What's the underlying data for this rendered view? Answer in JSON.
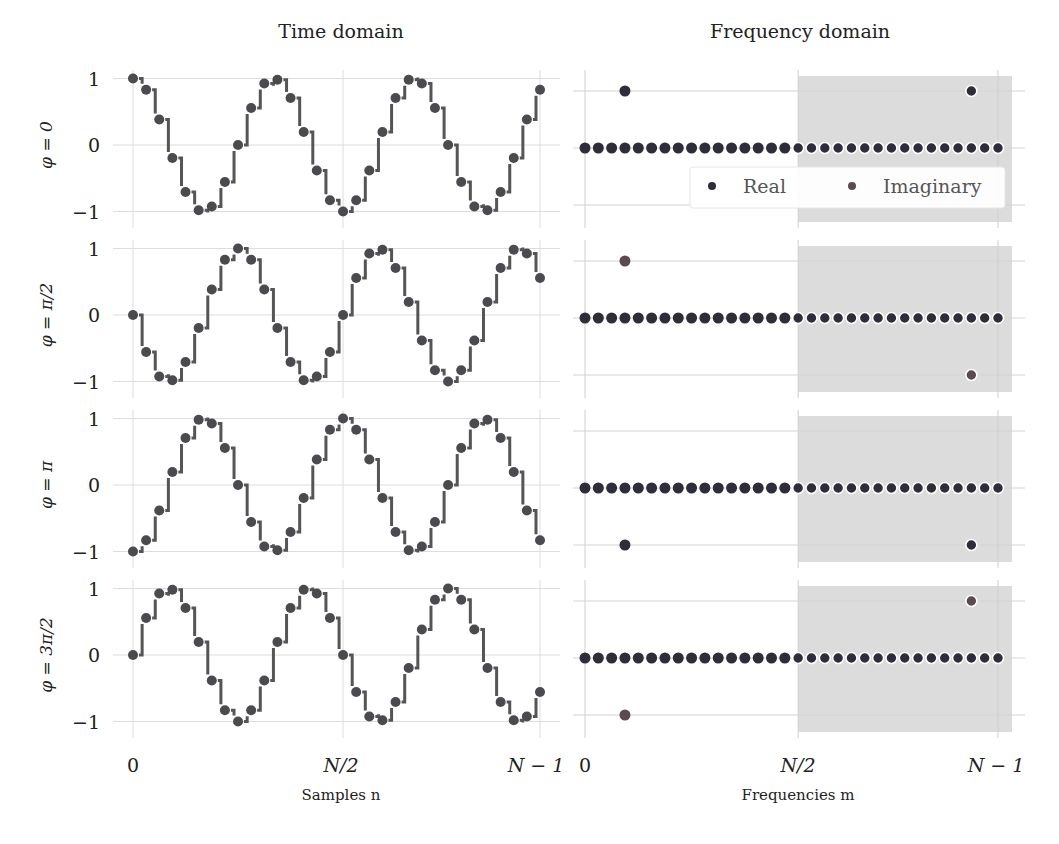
{
  "chart_data": {
    "type": "scatter",
    "title_left": "Time domain",
    "title_right": "Frequency domain",
    "N": 32,
    "time_domain": {
      "xlabel": "Samples n",
      "xticks": [
        "0",
        "N/2",
        "N − 1"
      ],
      "xtick_positions": [
        0,
        16,
        31
      ],
      "yticks": [
        "1",
        "0",
        "−1"
      ],
      "ytick_values": [
        1,
        0,
        -1
      ],
      "ylim": [
        -1.15,
        1.15
      ],
      "style": "step markers"
    },
    "frequency_domain": {
      "xlabel": "Frequencies m",
      "xticks": [
        "0",
        "N/2",
        "N − 1"
      ],
      "xtick_positions": [
        0,
        16,
        31
      ],
      "ygrid_values": [
        0.5,
        0,
        -0.5
      ],
      "ylim": [
        -0.6,
        0.6
      ],
      "shaded_region": [
        16,
        31.5
      ],
      "legend": [
        {
          "label": "Real",
          "color": "#2e2e3a"
        },
        {
          "label": "Imaginary",
          "color": "#5a4b52"
        }
      ]
    },
    "rows": [
      {
        "ylabel": "φ = 0",
        "samples": [
          1,
          0.831,
          0.383,
          -0.195,
          -0.707,
          -0.981,
          -0.924,
          -0.556,
          0,
          0.556,
          0.924,
          0.981,
          0.707,
          0.195,
          -0.383,
          -0.831,
          -1,
          -0.831,
          -0.383,
          0.195,
          0.707,
          0.981,
          0.924,
          0.556,
          0,
          -0.556,
          -0.924,
          -0.981,
          -0.707,
          -0.195,
          0.383,
          0.831
        ],
        "spectrum_peaks": [
          {
            "m": 3,
            "value": 0.5,
            "part": "real"
          },
          {
            "m": 29,
            "value": 0.5,
            "part": "real"
          }
        ]
      },
      {
        "ylabel": "φ = π/2",
        "samples": [
          0,
          -0.556,
          -0.924,
          -0.981,
          -0.707,
          -0.195,
          0.383,
          0.831,
          1,
          0.831,
          0.383,
          -0.195,
          -0.707,
          -0.981,
          -0.924,
          -0.556,
          0,
          0.556,
          0.924,
          0.981,
          0.707,
          0.195,
          -0.383,
          -0.831,
          -1,
          -0.831,
          -0.383,
          0.195,
          0.707,
          0.981,
          0.924,
          0.556
        ],
        "spectrum_peaks": [
          {
            "m": 3,
            "value": 0.5,
            "part": "imaginary"
          },
          {
            "m": 29,
            "value": -0.5,
            "part": "imaginary"
          }
        ]
      },
      {
        "ylabel": "φ = π",
        "samples": [
          -1,
          -0.831,
          -0.383,
          0.195,
          0.707,
          0.981,
          0.924,
          0.556,
          0,
          -0.556,
          -0.924,
          -0.981,
          -0.707,
          -0.195,
          0.383,
          0.831,
          1,
          0.831,
          0.383,
          -0.195,
          -0.707,
          -0.981,
          -0.924,
          -0.556,
          0,
          0.556,
          0.924,
          0.981,
          0.707,
          0.195,
          -0.383,
          -0.831
        ],
        "spectrum_peaks": [
          {
            "m": 3,
            "value": -0.5,
            "part": "real"
          },
          {
            "m": 29,
            "value": -0.5,
            "part": "real"
          }
        ]
      },
      {
        "ylabel": "φ = 3π/2",
        "samples": [
          0,
          0.556,
          0.924,
          0.981,
          0.707,
          0.195,
          -0.383,
          -0.831,
          -1,
          -0.831,
          -0.383,
          0.195,
          0.707,
          0.981,
          0.924,
          0.556,
          0,
          -0.556,
          -0.924,
          -0.981,
          -0.707,
          -0.195,
          0.383,
          0.831,
          1,
          0.831,
          0.383,
          -0.195,
          -0.707,
          -0.981,
          -0.924,
          -0.556
        ],
        "spectrum_peaks": [
          {
            "m": 3,
            "value": -0.5,
            "part": "imaginary"
          },
          {
            "m": 29,
            "value": 0.5,
            "part": "imaginary"
          }
        ]
      }
    ]
  },
  "colors": {
    "marker": "#4a4a4f",
    "step": "#555555",
    "grid": "#dddddd",
    "shade": "#dcdcdc"
  }
}
